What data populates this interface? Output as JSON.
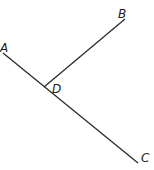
{
  "diagram": {
    "type": "geometry",
    "colors": {
      "line": "#2a2a2a",
      "label": "#222222",
      "background": "#ffffff"
    },
    "points": [
      {
        "id": "A",
        "label": "A",
        "x": 3,
        "y": 53,
        "label_x": 0,
        "label_y": 52
      },
      {
        "id": "B",
        "label": "B",
        "x": 125,
        "y": 19,
        "label_x": 118,
        "label_y": 18
      },
      {
        "id": "C",
        "label": "C",
        "x": 138,
        "y": 163,
        "label_x": 141,
        "label_y": 162
      },
      {
        "id": "D",
        "label": "D",
        "x": 44,
        "y": 87,
        "label_x": 52,
        "label_y": 93
      }
    ],
    "segments": [
      {
        "id": "AC",
        "from": "A",
        "to": "C"
      },
      {
        "id": "DB",
        "from": "D",
        "to": "B"
      }
    ]
  }
}
